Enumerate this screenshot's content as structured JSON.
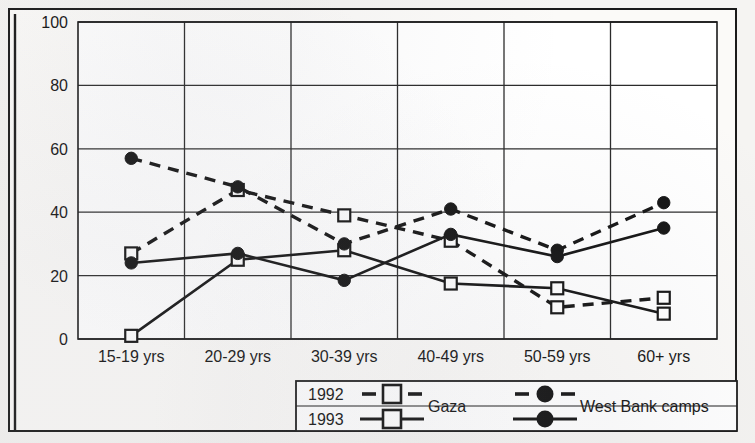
{
  "chart_data": {
    "type": "line",
    "title": "",
    "xlabel": "",
    "ylabel": "",
    "categories": [
      "15-19 yrs",
      "20-29 yrs",
      "30-39 yrs",
      "40-49 yrs",
      "50-59 yrs",
      "60+ yrs"
    ],
    "ylim": [
      0,
      100
    ],
    "yticks": [
      0,
      20,
      40,
      60,
      80,
      100
    ],
    "grid": true,
    "legend_position": "bottom",
    "series": [
      {
        "name": "1992 Gaza",
        "group": "Gaza",
        "year": "1992",
        "marker": "open-square",
        "line": "dashed",
        "values": [
          27,
          47,
          39,
          31,
          10,
          13
        ]
      },
      {
        "name": "1993 Gaza",
        "group": "Gaza",
        "year": "1993",
        "marker": "open-square",
        "line": "solid",
        "values": [
          1,
          25,
          28,
          17.5,
          16,
          8
        ]
      },
      {
        "name": "1992 West Bank camps",
        "group": "West Bank camps",
        "year": "1992",
        "marker": "filled-circle",
        "line": "dashed",
        "values": [
          57,
          48,
          30,
          41,
          28,
          43
        ]
      },
      {
        "name": "1993 West Bank camps",
        "group": "West Bank camps",
        "year": "1993",
        "marker": "filled-circle",
        "line": "solid",
        "values": [
          24,
          27,
          18.5,
          33,
          26,
          35
        ]
      }
    ]
  },
  "axis": {
    "y_tick_labels": [
      "100",
      "80",
      "60",
      "40",
      "20",
      "0"
    ],
    "x_tick_labels": [
      "15-19 yrs",
      "20-29 yrs",
      "30-39 yrs",
      "40-49 yrs",
      "50-59 yrs",
      "60+ yrs"
    ]
  },
  "legend": {
    "row_labels": [
      "1992",
      "1993"
    ],
    "group_labels": [
      "Gaza",
      "West Bank camps"
    ]
  },
  "colors": {
    "ink": "#141414",
    "paper": "#fbfaf8",
    "page": "#f3f2f0",
    "grid": "#2b2b2b"
  }
}
